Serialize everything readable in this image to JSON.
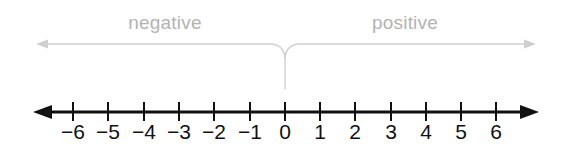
{
  "diagram": {
    "title_negative": "negative",
    "title_positive": "positive",
    "axis_color": "#111111",
    "bracket_color": "#c8c8c8",
    "label_color": "#b3b3b3",
    "background": "#ffffff"
  },
  "chart_data": {
    "type": "line",
    "xlabel": "",
    "ylabel": "",
    "xlim": [
      -6.6,
      6.6
    ],
    "grid": false,
    "legend": [
      "negative",
      "positive"
    ],
    "categories": [
      "-6",
      "-5",
      "-4",
      "-3",
      "-2",
      "-1",
      "0",
      "1",
      "2",
      "3",
      "4",
      "5",
      "6"
    ],
    "values": [
      -6,
      -5,
      -4,
      -3,
      -2,
      -1,
      0,
      1,
      2,
      3,
      4,
      5,
      6
    ],
    "annotations": [
      {
        "text": "negative",
        "range": [
          -6.6,
          0
        ],
        "position": "above-left"
      },
      {
        "text": "positive",
        "range": [
          0,
          6.6
        ],
        "position": "above-right"
      }
    ],
    "tick_labels": [
      "-6",
      "-5",
      "-4",
      "-3",
      "-2",
      "-1",
      "0",
      "1",
      "2",
      "3",
      "4",
      "5",
      "6"
    ],
    "arrows": [
      "left",
      "right"
    ]
  },
  "ticks": [
    {
      "label": "-6",
      "value": -6,
      "x": 73
    },
    {
      "label": "-5",
      "value": -5,
      "x": 108
    },
    {
      "label": "-4",
      "value": -4,
      "x": 144
    },
    {
      "label": "-3",
      "value": -3,
      "x": 179
    },
    {
      "label": "-2",
      "value": -2,
      "x": 214
    },
    {
      "label": "-1",
      "value": -1,
      "x": 250
    },
    {
      "label": "0",
      "value": 0,
      "x": 285
    },
    {
      "label": "1",
      "value": 1,
      "x": 320
    },
    {
      "label": "2",
      "value": 2,
      "x": 355
    },
    {
      "label": "3",
      "value": 3,
      "x": 391
    },
    {
      "label": "4",
      "value": 4,
      "x": 426
    },
    {
      "label": "5",
      "value": 5,
      "x": 461
    },
    {
      "label": "6",
      "value": 6,
      "x": 496
    }
  ]
}
